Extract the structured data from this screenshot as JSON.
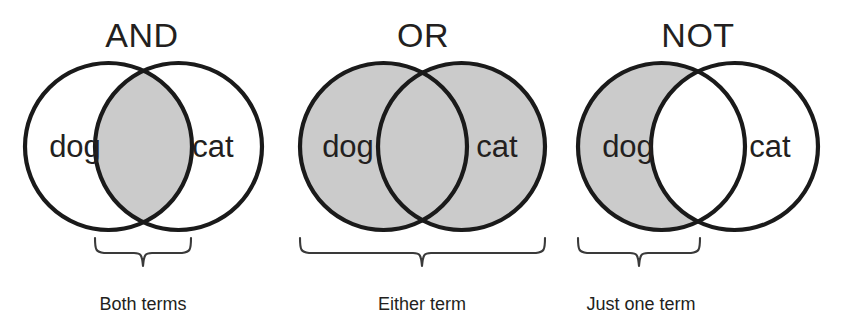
{
  "figure": {
    "kind": "venn-diagram-set",
    "background_color": "#ffffff",
    "shade_color": "#cbcbcb",
    "outline_color": "#1a1a1a",
    "text_color": "#231f20",
    "brace_color": "#3a3a3a"
  },
  "panels": [
    {
      "id": "and",
      "title": "AND",
      "left_label": "dog",
      "right_label": "cat",
      "caption": "Both terms",
      "shaded_region": "intersection",
      "brace_span": "intersection"
    },
    {
      "id": "or",
      "title": "OR",
      "left_label": "dog",
      "right_label": "cat",
      "caption": "Either term",
      "shaded_region": "union",
      "brace_span": "union"
    },
    {
      "id": "not",
      "title": "NOT",
      "left_label": "dog",
      "right_label": "cat",
      "caption": "Just one term",
      "shaded_region": "left-only",
      "brace_span": "left-circle"
    }
  ],
  "geometry": {
    "circle_radius": 83.5,
    "circle_center_y": 146.5,
    "panel_and": {
      "left_cx": 108.5,
      "right_cx": 178.5
    },
    "panel_or": {
      "left_cx": 383.5,
      "right_cx": 461.5
    },
    "panel_not": {
      "left_cx": 661.5,
      "right_cx": 734.5
    },
    "title_y": 47,
    "label_y": 157,
    "caption_y": 310
  }
}
